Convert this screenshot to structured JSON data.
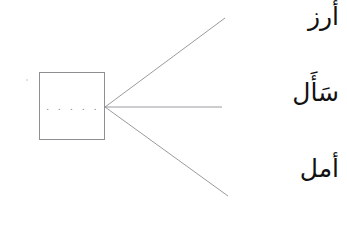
{
  "worksheet": {
    "type": "matching-exercise",
    "direction": "rtl",
    "blank": {
      "label": "answer-box",
      "value": ". . . . .",
      "dot_count": 5
    },
    "connector_lines": [
      {
        "name": "line-to-rice",
        "from": [
          105,
          107
        ],
        "to": [
          225,
          18
        ]
      },
      {
        "name": "line-to-asked",
        "from": [
          105,
          107
        ],
        "to": [
          222,
          107
        ]
      },
      {
        "name": "line-to-hope",
        "from": [
          105,
          107
        ],
        "to": [
          228,
          196
        ]
      }
    ],
    "options": [
      {
        "id": "rice",
        "text": "أرز",
        "transliteration": "aruzz"
      },
      {
        "id": "asked",
        "text": "سَأَل",
        "transliteration": "sa'ala"
      },
      {
        "id": "hope",
        "text": "أمل",
        "transliteration": "amal"
      }
    ],
    "colors": {
      "background": "#ffffff",
      "ink": "#111111",
      "line": "#8d8f93",
      "dots": "#8a8c90"
    }
  }
}
